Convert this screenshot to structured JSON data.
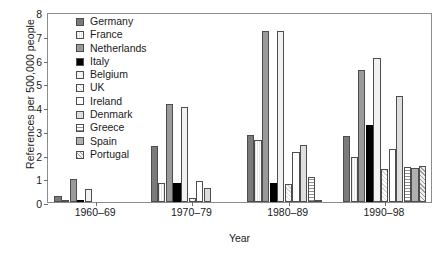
{
  "chart_data": {
    "type": "bar",
    "title": "",
    "xlabel": "Year",
    "ylabel": "References per 500,000 people",
    "categories": [
      "1960–69",
      "1970–79",
      "1980–89",
      "1990–98"
    ],
    "ylim": [
      0,
      8
    ],
    "yticks": [
      0,
      1,
      2,
      3,
      4,
      5,
      6,
      7,
      8
    ],
    "grid": false,
    "legend_position": "upper-left-inside",
    "series": [
      {
        "name": "Germany",
        "swatch": "solid-dark-gray",
        "color": "#7b7b7b",
        "values": [
          0.25,
          2.35,
          2.82,
          2.76
        ]
      },
      {
        "name": "France",
        "swatch": "vertical-lines",
        "color": "#e6e6e6",
        "values": [
          0.1,
          0.82,
          2.6,
          1.88
        ]
      },
      {
        "name": "Netherlands",
        "swatch": "solid-mid-gray",
        "color": "#9a9a9a",
        "values": [
          0.96,
          4.12,
          7.2,
          5.56
        ]
      },
      {
        "name": "Italy",
        "swatch": "solid-black",
        "color": "#000000",
        "values": [
          0.05,
          0.79,
          0.79,
          3.24
        ]
      },
      {
        "name": "Belgium",
        "swatch": "solid-very-light",
        "color": "#f2f2f2",
        "values": [
          0.54,
          4.0,
          7.2,
          6.08
        ]
      },
      {
        "name": "UK",
        "swatch": "cross-hatch-light",
        "color": "#fafafa",
        "values": [
          0,
          0.19,
          0.74,
          1.38
        ]
      },
      {
        "name": "Ireland",
        "swatch": "white",
        "color": "#ffffff",
        "values": [
          0,
          0.9,
          2.12,
          2.24
        ]
      },
      {
        "name": "Denmark",
        "swatch": "solid-light-gray",
        "color": "#dedede",
        "values": [
          0,
          0.61,
          2.4,
          4.46
        ]
      },
      {
        "name": "Greece",
        "swatch": "horizontal-lines",
        "color": "#8f8f8f",
        "values": [
          0,
          0,
          1.05,
          1.47
        ]
      },
      {
        "name": "Spain",
        "swatch": "solid-gray",
        "color": "#b0b0b0",
        "values": [
          0,
          0,
          0.06,
          1.45
        ]
      },
      {
        "name": "Portugal",
        "swatch": "checker-hatch",
        "color": "#9d9d9d",
        "values": [
          0,
          0,
          0,
          1.5
        ]
      }
    ]
  }
}
